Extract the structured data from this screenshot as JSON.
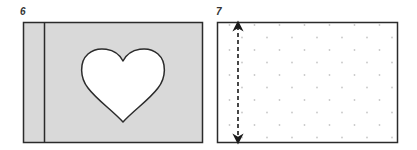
{
  "figures": [
    {
      "label": "6",
      "description": "Grey card with a vertical fold line near the left edge and a heart-shaped cut-out",
      "fill_color": "#d9d9d9",
      "heart_fill": "#ffffff"
    },
    {
      "label": "7",
      "description": "White dotted card with a dashed double-headed vertical arrow near the left edge",
      "fill_color": "#ffffff",
      "dot_color": "#c8c8c8"
    }
  ],
  "colors": {
    "stroke": "#2b2b2b",
    "grey_fill": "#d9d9d9"
  }
}
